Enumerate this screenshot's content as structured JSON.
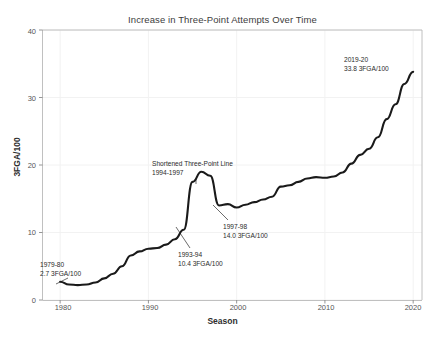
{
  "chart_data": {
    "type": "line",
    "title": "Increase in Three-Point Attempts Over Time",
    "xlabel": "Season",
    "ylabel": "3FGA/100",
    "xlim": [
      1978,
      2021
    ],
    "ylim": [
      0,
      40
    ],
    "xticks": [
      "1980",
      "1990",
      "2000",
      "2010",
      "2020"
    ],
    "xtick_values": [
      1980,
      1990,
      2000,
      2010,
      2020
    ],
    "yticks": [
      "0",
      "10",
      "20",
      "30",
      "40"
    ],
    "ytick_values": [
      0,
      10,
      20,
      30,
      40
    ],
    "grid": true,
    "legend": "none",
    "line_color": "#1a1a1a",
    "x": [
      1980,
      1981,
      1982,
      1983,
      1984,
      1985,
      1986,
      1987,
      1988,
      1989,
      1990,
      1991,
      1992,
      1993,
      1994,
      1995,
      1996,
      1997,
      1998,
      1999,
      2000,
      2001,
      2002,
      2003,
      2004,
      2005,
      2006,
      2007,
      2008,
      2009,
      2010,
      2011,
      2012,
      2013,
      2014,
      2015,
      2016,
      2017,
      2018,
      2019,
      2020
    ],
    "values": [
      2.7,
      2.3,
      2.2,
      2.3,
      2.6,
      3.2,
      3.9,
      5.0,
      6.6,
      7.2,
      7.6,
      7.7,
      8.2,
      9.0,
      10.4,
      17.5,
      19.0,
      18.4,
      14.0,
      14.2,
      13.7,
      14.1,
      14.5,
      14.9,
      15.3,
      16.8,
      17.0,
      17.5,
      18.0,
      18.2,
      18.1,
      18.3,
      18.9,
      20.2,
      21.5,
      22.4,
      24.1,
      26.8,
      29.0,
      32.0,
      33.8
    ],
    "series_name": "3FGA per 100 possessions",
    "annotations": [
      {
        "id": "first-season",
        "line1": "1979-80",
        "line2": "2.7 3FGA/100",
        "x_px": 40,
        "y_px": 260,
        "leader": {
          "x1": 68,
          "y1": 278,
          "x2": 56,
          "y2": 284
        }
      },
      {
        "id": "shortened-line",
        "line1": "Shortened Three-Point Line",
        "line2": "1994-1997",
        "x_px": 152,
        "y_px": 159,
        "leader": {
          "x1": 196,
          "y1": 178,
          "x2": 196,
          "y2": 184
        }
      },
      {
        "id": "season-1993-94",
        "line1": "1993-94",
        "line2": "10.4 3FGA/100",
        "x_px": 178,
        "y_px": 250,
        "leader": {
          "x1": 190,
          "y1": 248,
          "x2": 176,
          "y2": 227
        }
      },
      {
        "id": "season-1997-98",
        "line1": "1997-98",
        "line2": "14.0 3FGA/100",
        "x_px": 223,
        "y_px": 222,
        "leader": {
          "x1": 228,
          "y1": 220,
          "x2": 213,
          "y2": 205
        }
      },
      {
        "id": "season-2019-20",
        "line1": "2019-20",
        "line2": "33.8 3FGA/100",
        "x_px": 344,
        "y_px": 55,
        "leader": null
      }
    ]
  }
}
